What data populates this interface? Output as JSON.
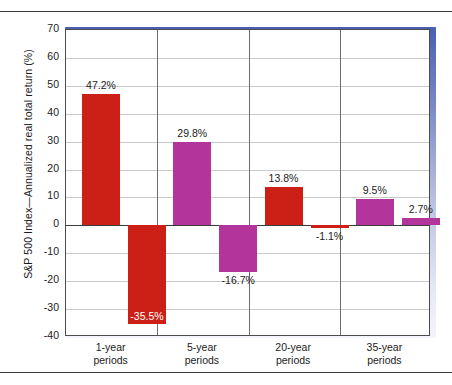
{
  "figure": {
    "ylabel": "S&P 500 Index—Annualized real total return (%)"
  },
  "chart_data": {
    "type": "bar",
    "title": "",
    "xlabel": "",
    "ylabel": "S&P 500 Index—Annualized real total return (%)",
    "ylim": [
      -40,
      70
    ],
    "ytick_labels": [
      "70",
      "60",
      "50",
      "40",
      "30",
      "20",
      "10",
      "0",
      "-10",
      "-20",
      "-30",
      "-40"
    ],
    "ytick_values": [
      70,
      60,
      50,
      40,
      30,
      20,
      10,
      0,
      -10,
      -20,
      -30,
      -40
    ],
    "grid": true,
    "legend": "none",
    "categories": [
      "1-year periods",
      "5-year periods",
      "20-year periods",
      "35-year periods"
    ],
    "category_lines": [
      {
        "line1": "1-year",
        "line2": "periods"
      },
      {
        "line1": "5-year",
        "line2": "periods"
      },
      {
        "line1": "20-year",
        "line2": "periods"
      },
      {
        "line1": "35-year",
        "line2": "periods"
      }
    ],
    "series": [
      {
        "name": "Best",
        "values": [
          47.2,
          29.8,
          13.8,
          9.5
        ]
      },
      {
        "name": "Worst",
        "values": [
          -35.5,
          -16.7,
          -1.1,
          2.7
        ]
      }
    ],
    "bars": [
      {
        "category": "1-year periods",
        "kind": "best",
        "value": 47.2,
        "label": "47.2%",
        "color": "#cc1f15",
        "label_position": "above"
      },
      {
        "category": "1-year periods",
        "kind": "worst",
        "value": -35.5,
        "label": "-35.5%",
        "color": "#cc1f15",
        "label_position": "inside"
      },
      {
        "category": "5-year periods",
        "kind": "best",
        "value": 29.8,
        "label": "29.8%",
        "color": "#b3359b",
        "label_position": "above"
      },
      {
        "category": "5-year periods",
        "kind": "worst",
        "value": -16.7,
        "label": "-16.7%",
        "color": "#b3359b",
        "label_position": "below"
      },
      {
        "category": "20-year periods",
        "kind": "best",
        "value": 13.8,
        "label": "13.8%",
        "color": "#cc1f15",
        "label_position": "above"
      },
      {
        "category": "20-year periods",
        "kind": "worst",
        "value": -1.1,
        "label": "-1.1%",
        "color": "#cc1f15",
        "label_position": "below"
      },
      {
        "category": "35-year periods",
        "kind": "best",
        "value": 9.5,
        "label": "9.5%",
        "color": "#b3359b",
        "label_position": "above"
      },
      {
        "category": "35-year periods",
        "kind": "worst",
        "value": 2.7,
        "label": "2.7%",
        "color": "#b3359b",
        "label_position": "above"
      }
    ],
    "colors": {
      "red": "#cc1f15",
      "magenta": "#b3359b",
      "grid": "#c9c9c9",
      "axis": "#4d4d4d",
      "shadow_blue": "#4a5fb0"
    }
  }
}
